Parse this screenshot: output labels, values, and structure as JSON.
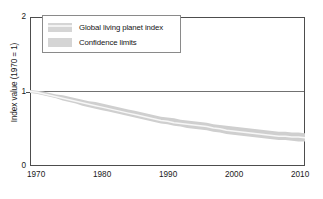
{
  "chart_data": {
    "type": "line",
    "title": "",
    "subtitle": "",
    "xlabel": "",
    "ylabel": "Index value (1970 = 1)",
    "xlim": [
      1970,
      2012
    ],
    "ylim": [
      0,
      2
    ],
    "grid": false,
    "legend_position": "top-left",
    "x_ticks": [
      "1970",
      "1980",
      "1990",
      "2000",
      "2010"
    ],
    "x_tick_values": [
      1970,
      1980,
      1990,
      2000,
      2010
    ],
    "y_ticks": [
      "0",
      "1",
      "2"
    ],
    "y_tick_values": [
      0,
      1,
      2
    ],
    "reference_line": {
      "y": 1,
      "label": ""
    },
    "legend": [
      {
        "label": "Global living planet index",
        "swatch": "band-swatch"
      },
      {
        "label": "Confidence limits",
        "swatch": "solid-swatch"
      }
    ],
    "x": [
      1970,
      1971,
      1972,
      1973,
      1974,
      1975,
      1976,
      1977,
      1978,
      1979,
      1980,
      1981,
      1982,
      1983,
      1984,
      1985,
      1986,
      1987,
      1988,
      1989,
      1990,
      1991,
      1992,
      1993,
      1994,
      1995,
      1996,
      1997,
      1998,
      1999,
      2000,
      2001,
      2002,
      2003,
      2004,
      2005,
      2006,
      2007,
      2008,
      2009,
      2010,
      2011,
      2012
    ],
    "series": [
      {
        "name": "Global living planet index",
        "values": [
          1.0,
          0.99,
          0.97,
          0.95,
          0.93,
          0.91,
          0.89,
          0.87,
          0.85,
          0.83,
          0.81,
          0.79,
          0.77,
          0.75,
          0.73,
          0.71,
          0.69,
          0.67,
          0.65,
          0.63,
          0.61,
          0.6,
          0.58,
          0.57,
          0.56,
          0.55,
          0.54,
          0.53,
          0.51,
          0.5,
          0.48,
          0.47,
          0.46,
          0.45,
          0.44,
          0.43,
          0.42,
          0.41,
          0.4,
          0.4,
          0.39,
          0.39,
          0.38
        ]
      },
      {
        "name": "Confidence limits upper",
        "values": [
          1.02,
          1.01,
          1.0,
          0.98,
          0.96,
          0.95,
          0.93,
          0.91,
          0.89,
          0.87,
          0.86,
          0.84,
          0.82,
          0.8,
          0.78,
          0.76,
          0.74,
          0.72,
          0.7,
          0.68,
          0.66,
          0.65,
          0.64,
          0.62,
          0.61,
          0.6,
          0.59,
          0.58,
          0.56,
          0.55,
          0.54,
          0.53,
          0.52,
          0.51,
          0.5,
          0.49,
          0.48,
          0.47,
          0.46,
          0.46,
          0.45,
          0.45,
          0.44
        ]
      },
      {
        "name": "Confidence limits lower",
        "values": [
          0.98,
          0.97,
          0.95,
          0.93,
          0.91,
          0.88,
          0.86,
          0.84,
          0.81,
          0.79,
          0.77,
          0.75,
          0.73,
          0.71,
          0.69,
          0.67,
          0.65,
          0.63,
          0.61,
          0.59,
          0.57,
          0.56,
          0.54,
          0.53,
          0.51,
          0.5,
          0.49,
          0.48,
          0.46,
          0.45,
          0.43,
          0.42,
          0.41,
          0.4,
          0.39,
          0.38,
          0.37,
          0.36,
          0.35,
          0.35,
          0.34,
          0.33,
          0.33
        ]
      }
    ],
    "colors": {
      "band": "#cfcfcf",
      "line": "#f5f5f5",
      "axis": "#4d4d4d",
      "text": "#1a1a1a",
      "legend_border": "#8a8a8a"
    }
  }
}
